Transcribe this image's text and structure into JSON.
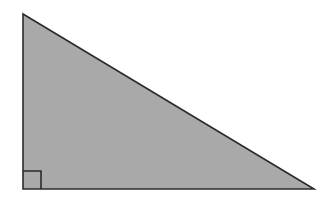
{
  "figure": {
    "name": "right-triangle",
    "canvas": {
      "width": 324,
      "height": 202,
      "background": "#ffffff"
    },
    "colors": {
      "fill": "#a9a9a9",
      "stroke": "#2b2b2b",
      "right_angle_marker": "#2b2b2b",
      "label": "#3a3a3a"
    },
    "stroke_width": 1.6,
    "vertices": {
      "apex": {
        "label": "apex",
        "x": 23,
        "y": 14
      },
      "right_angle": {
        "label": "right-angle-vertex",
        "x": 23,
        "y": 189
      },
      "base_right": {
        "label": "base-right-vertex",
        "x": 314,
        "y": 189
      }
    },
    "points_path": "23,14 23,189 314,189",
    "right_angle_marker": {
      "x": 23,
      "y": 171,
      "size": 18,
      "path": "M 23 171 L 41 171 L 41 189"
    },
    "edge_label_clipped": {
      "name": "left-side-label",
      "text": "3",
      "note": "glyph clipped by left edge of image"
    }
  }
}
